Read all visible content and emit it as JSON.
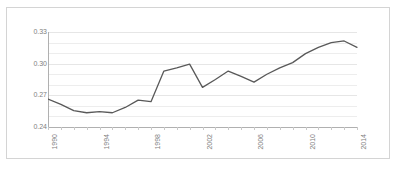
{
  "chart": {
    "background_color": "#ffffff",
    "border_color": "#d4d4d4",
    "line_color": "#595959",
    "gridline_color": "#ededed",
    "axis_color": "#b0b0b0",
    "tick_label_color": "#808080"
  },
  "chart_data": {
    "type": "line",
    "title": "",
    "subtitle": "",
    "xlabel": "",
    "ylabel": "",
    "grid": true,
    "legend": false,
    "legend_position": "none",
    "ylim": [
      0.24,
      0.33
    ],
    "ytick_labels": [
      "0.33",
      "0.30",
      "0.27",
      "0.24"
    ],
    "ytick_values": [
      0.33,
      0.3,
      0.27,
      0.24
    ],
    "minor_gridline_step": 0.01,
    "xlim": [
      1990,
      2014
    ],
    "xtick_labels": [
      "1990",
      "1994",
      "1998",
      "2002",
      "2006",
      "2010",
      "2014"
    ],
    "xtick_values": [
      1990,
      1994,
      1998,
      2002,
      2006,
      2010,
      2014
    ],
    "x": [
      1990,
      1991,
      1992,
      1993,
      1994,
      1995,
      1996,
      1997,
      1998,
      1999,
      2000,
      2001,
      2002,
      2003,
      2004,
      2005,
      2006,
      2007,
      2008,
      2009,
      2010,
      2011,
      2012,
      2013,
      2014
    ],
    "series": [
      {
        "name": "",
        "values": [
          0.2665,
          0.2615,
          0.2555,
          0.2535,
          0.2545,
          0.2535,
          0.2585,
          0.2655,
          0.264,
          0.293,
          0.296,
          0.2995,
          0.2775,
          0.285,
          0.293,
          0.288,
          0.2825,
          0.29,
          0.296,
          0.301,
          0.3095,
          0.3155,
          0.32,
          0.3215,
          0.3155
        ]
      }
    ],
    "series_trailing": [
      0.3135,
      0.308,
      0.307,
      0.3075
    ]
  }
}
